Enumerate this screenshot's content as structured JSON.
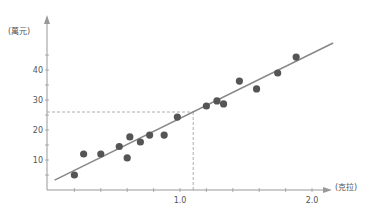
{
  "chart_data": {
    "type": "scatter",
    "title": "",
    "xlabel": "(克拉)",
    "ylabel": "(萬元)",
    "x_ticks": [
      {
        "value": 1.0,
        "label": "1.0"
      },
      {
        "value": 2.0,
        "label": "2.0"
      }
    ],
    "y_ticks": [
      {
        "value": 10,
        "label": "10"
      },
      {
        "value": 20,
        "label": "20"
      },
      {
        "value": 30,
        "label": "30"
      },
      {
        "value": 40,
        "label": "40"
      }
    ],
    "xlim": [
      0,
      2.3
    ],
    "ylim": [
      0,
      50
    ],
    "grid": false,
    "series": [
      {
        "name": "data points",
        "points": [
          [
            0.2,
            5
          ],
          [
            0.27,
            12
          ],
          [
            0.4,
            12
          ],
          [
            0.54,
            14.5
          ],
          [
            0.6,
            10.7
          ],
          [
            0.62,
            17.7
          ],
          [
            0.7,
            16
          ],
          [
            0.77,
            18.3
          ],
          [
            0.88,
            18.3
          ],
          [
            0.98,
            24.3
          ],
          [
            1.2,
            28
          ],
          [
            1.28,
            29.7
          ],
          [
            1.33,
            28.7
          ],
          [
            1.45,
            36.3
          ],
          [
            1.58,
            33.7
          ],
          [
            1.74,
            39
          ],
          [
            1.88,
            44.3
          ]
        ]
      }
    ],
    "regression_line": {
      "from": [
        0.05,
        3.3
      ],
      "to": [
        2.16,
        49
      ]
    },
    "annotation": {
      "type": "dashed-crosshair",
      "x": 1.1,
      "y": 26
    },
    "colors": {
      "points": "#555555",
      "line": "#888888",
      "axis": "#999999",
      "dashed": "#999999"
    }
  }
}
